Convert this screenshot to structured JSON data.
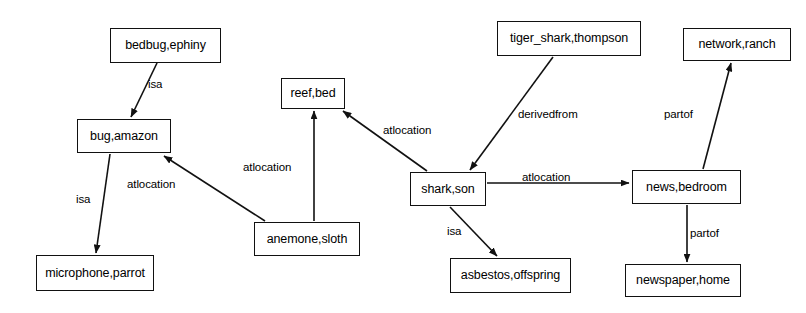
{
  "diagram": {
    "type": "knowledge-graph",
    "canvas": {
      "width": 806,
      "height": 313,
      "background": "#ffffff",
      "stroke": "#111111"
    },
    "nodes": [
      {
        "id": "bedbug",
        "label": "bedbug,ephiny",
        "x": 110,
        "y": 28,
        "w": 111,
        "h": 35
      },
      {
        "id": "bug",
        "label": "bug,amazon",
        "x": 77,
        "y": 119,
        "w": 94,
        "h": 34
      },
      {
        "id": "microphone",
        "label": "microphone,parrot",
        "x": 36,
        "y": 255,
        "w": 118,
        "h": 36
      },
      {
        "id": "reef",
        "label": "reef,bed",
        "x": 281,
        "y": 78,
        "w": 64,
        "h": 31
      },
      {
        "id": "anemone",
        "label": "anemone,sloth",
        "x": 254,
        "y": 222,
        "w": 106,
        "h": 34
      },
      {
        "id": "shark",
        "label": "shark,son",
        "x": 410,
        "y": 172,
        "w": 76,
        "h": 34
      },
      {
        "id": "tiger",
        "label": "tiger_shark,thompson",
        "x": 497,
        "y": 21,
        "w": 144,
        "h": 35
      },
      {
        "id": "asbestos",
        "label": "asbestos,offspring",
        "x": 450,
        "y": 258,
        "w": 121,
        "h": 35
      },
      {
        "id": "network",
        "label": "network,ranch",
        "x": 683,
        "y": 28,
        "w": 108,
        "h": 33
      },
      {
        "id": "news",
        "label": "news,bedroom",
        "x": 632,
        "y": 170,
        "w": 109,
        "h": 34
      },
      {
        "id": "newspaper",
        "label": "newspaper,home",
        "x": 625,
        "y": 264,
        "w": 116,
        "h": 33
      }
    ],
    "edges": [
      {
        "id": "e1",
        "from": "bedbug",
        "to": "bug",
        "label": "isa",
        "x1": 157,
        "y1": 63,
        "x2": 131,
        "y2": 117,
        "lx": 148,
        "ly": 79
      },
      {
        "id": "e2",
        "from": "bug",
        "to": "microphone",
        "label": "isa",
        "x1": 110,
        "y1": 154,
        "x2": 96,
        "y2": 253,
        "lx": 76,
        "ly": 194
      },
      {
        "id": "e3",
        "from": "anemone",
        "to": "bug",
        "label": "atlocation",
        "x1": 265,
        "y1": 221,
        "x2": 164,
        "y2": 156,
        "lx": 127,
        "ly": 179
      },
      {
        "id": "e4",
        "from": "anemone",
        "to": "reef",
        "label": "atlocation",
        "x1": 314,
        "y1": 221,
        "x2": 314,
        "y2": 111,
        "lx": 243,
        "ly": 162
      },
      {
        "id": "e5",
        "from": "shark",
        "to": "reef",
        "label": "atlocation",
        "x1": 427,
        "y1": 171,
        "x2": 343,
        "y2": 111,
        "lx": 383,
        "ly": 125
      },
      {
        "id": "e6",
        "from": "tiger",
        "to": "shark",
        "label": "derivedfrom",
        "x1": 553,
        "y1": 57,
        "x2": 470,
        "y2": 170,
        "lx": 518,
        "ly": 109
      },
      {
        "id": "e7",
        "from": "shark",
        "to": "news",
        "label": "atlocation",
        "x1": 487,
        "y1": 183,
        "x2": 629,
        "y2": 183,
        "lx": 522,
        "ly": 172
      },
      {
        "id": "e8",
        "from": "shark",
        "to": "asbestos",
        "label": "isa",
        "x1": 450,
        "y1": 207,
        "x2": 497,
        "y2": 256,
        "lx": 447,
        "ly": 226
      },
      {
        "id": "e9",
        "from": "news",
        "to": "network",
        "label": "partof",
        "x1": 703,
        "y1": 169,
        "x2": 731,
        "y2": 63,
        "lx": 664,
        "ly": 109
      },
      {
        "id": "e10",
        "from": "news",
        "to": "newspaper",
        "label": "partof",
        "x1": 687,
        "y1": 205,
        "x2": 687,
        "y2": 262,
        "lx": 690,
        "ly": 228
      }
    ]
  }
}
